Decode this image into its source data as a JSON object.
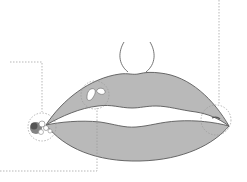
{
  "figure": {
    "colors": {
      "lip_fill": "#b9b9b9",
      "lip_outline": "#5a5a5a",
      "callout_line": "#9a9a9a",
      "lesion_dark": "#6e6e6e",
      "background": "#ffffff"
    },
    "callouts": [
      {
        "id": "left-commissure",
        "label": ""
      },
      {
        "id": "upper-lip-patch",
        "label": ""
      },
      {
        "id": "right-commissure",
        "label": ""
      }
    ]
  }
}
